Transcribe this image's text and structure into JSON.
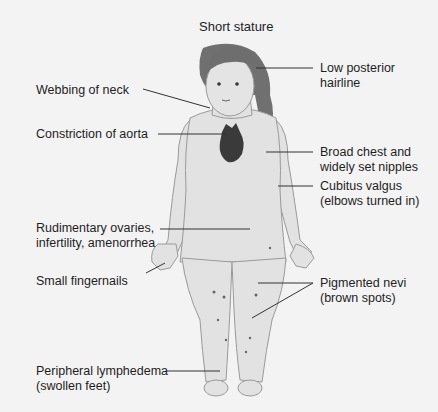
{
  "title": "Short stature",
  "labels": {
    "low_posterior_hairline": [
      "Low posterior",
      "hairline"
    ],
    "webbing_of_neck": "Webbing of neck",
    "constriction_of_aorta": "Constriction of aorta",
    "broad_chest": [
      "Broad chest and",
      "widely set nipples"
    ],
    "cubitus_valgus": [
      "Cubitus valgus",
      "(elbows turned in)"
    ],
    "rudimentary_ovaries": [
      "Rudimentary ovaries,",
      "infertility, amenorrhea"
    ],
    "small_fingernails": "Small fingernails",
    "pigmented_nevi": [
      "Pigmented nevi",
      "(brown spots)"
    ],
    "peripheral_lymphedema": [
      "Peripheral lymphedema",
      "(swollen feet)"
    ]
  },
  "colors": {
    "background": "#f3f3f3",
    "skin": "#e2e2e2",
    "outline": "#9a9a9a",
    "hair": "#6e6e6e",
    "heart": "#3a3a3a",
    "leader_line": "#333333"
  }
}
